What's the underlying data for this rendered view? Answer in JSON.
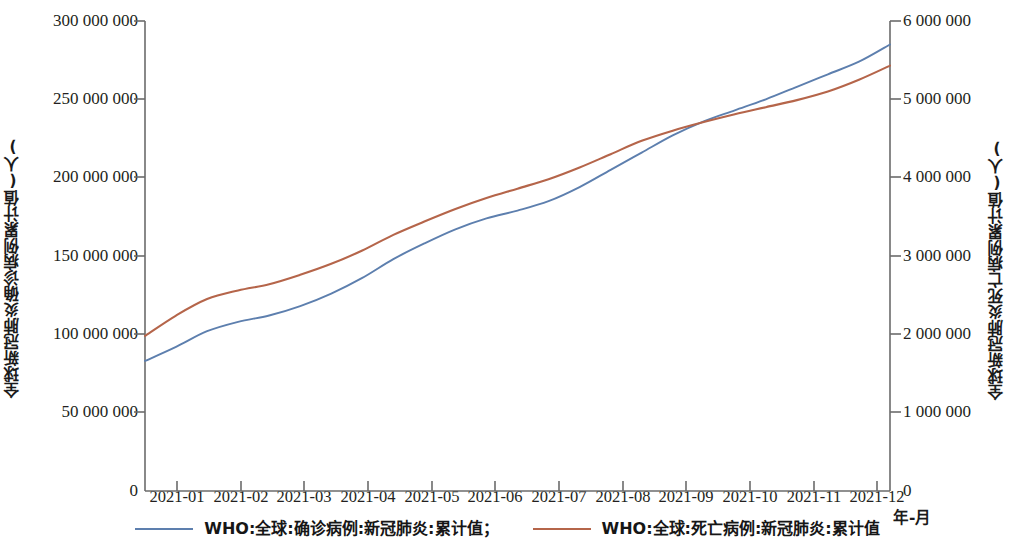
{
  "chart_data": {
    "type": "line",
    "title": "",
    "xlabel": "年-月",
    "grid": false,
    "legend_position": "bottom",
    "x_tick_labels": [
      "2021-01",
      "2021-02",
      "2021-03",
      "2021-04",
      "2021-05",
      "2021-06",
      "2021-07",
      "2021-08",
      "2021-09",
      "2021-10",
      "2021-11",
      "2021-12"
    ],
    "axes": {
      "left": {
        "label": "全球新冠肺炎确诊病例累计值(人)",
        "ylim": [
          0,
          300000000
        ],
        "tick_labels": [
          "300 000 000",
          "250 000 000",
          "200 000 000",
          "150 000 000",
          "100 000 000",
          "50 000 000",
          "0"
        ],
        "tick_values": [
          300000000,
          250000000,
          200000000,
          150000000,
          100000000,
          50000000,
          0
        ]
      },
      "right": {
        "label": "全球新冠肺炎死亡病例累计值(人)",
        "ylim": [
          0,
          6000000
        ],
        "tick_labels": [
          "6 000 000",
          "5 000 000",
          "4 000 000",
          "3 000 000",
          "2 000 000",
          "1 000 000",
          "0"
        ],
        "tick_values": [
          6000000,
          5000000,
          4000000,
          3000000,
          2000000,
          1000000,
          0
        ]
      }
    },
    "series": [
      {
        "name": "WHO:全球:确诊病例:新冠肺炎:累计值；",
        "axis": "left",
        "color": "#5d7fae",
        "x": [
          "2021-01",
          "2021-01-15",
          "2021-02",
          "2021-02-15",
          "2021-03",
          "2021-03-15",
          "2021-04",
          "2021-04-15",
          "2021-05",
          "2021-05-15",
          "2021-06",
          "2021-06-15",
          "2021-07",
          "2021-07-15",
          "2021-08",
          "2021-08-15",
          "2021-09",
          "2021-09-15",
          "2021-10",
          "2021-10-15",
          "2021-11",
          "2021-11-15",
          "2021-12",
          "2021-12-15",
          "2021-12-31"
        ],
        "values": [
          83000000,
          92000000,
          102000000,
          108000000,
          112000000,
          118000000,
          126000000,
          136000000,
          148000000,
          158000000,
          167000000,
          174000000,
          179000000,
          185000000,
          194000000,
          205000000,
          216000000,
          227000000,
          236000000,
          243000000,
          250000000,
          258000000,
          266000000,
          274000000,
          285000000
        ]
      },
      {
        "name": "WHO:全球:死亡病例:新冠肺炎:累计值",
        "axis": "right",
        "color": "#b5654a",
        "x": [
          "2021-01",
          "2021-01-15",
          "2021-02",
          "2021-02-15",
          "2021-03",
          "2021-03-15",
          "2021-04",
          "2021-04-15",
          "2021-05",
          "2021-05-15",
          "2021-06",
          "2021-06-15",
          "2021-07",
          "2021-07-15",
          "2021-08",
          "2021-08-15",
          "2021-09",
          "2021-09-15",
          "2021-10",
          "2021-10-15",
          "2021-11",
          "2021-11-15",
          "2021-12",
          "2021-12-15",
          "2021-12-31"
        ],
        "values": [
          1980000,
          2240000,
          2450000,
          2560000,
          2640000,
          2760000,
          2900000,
          3070000,
          3270000,
          3440000,
          3600000,
          3740000,
          3860000,
          3980000,
          4130000,
          4300000,
          4470000,
          4600000,
          4710000,
          4810000,
          4900000,
          4990000,
          5100000,
          5250000,
          5430000
        ]
      }
    ],
    "notes": {
      "left_axis_max_label": "300 000 000",
      "right_axis_max_label": "6 000 000",
      "crossover_note": "Lines cross near 2021-11"
    }
  },
  "legend": {
    "items": [
      {
        "label": "WHO:全球:确诊病例:新冠肺炎:累计值；",
        "color": "#5d7fae"
      },
      {
        "label": "WHO:全球:死亡病例:新冠肺炎:累计值",
        "color": "#b5654a"
      }
    ]
  }
}
